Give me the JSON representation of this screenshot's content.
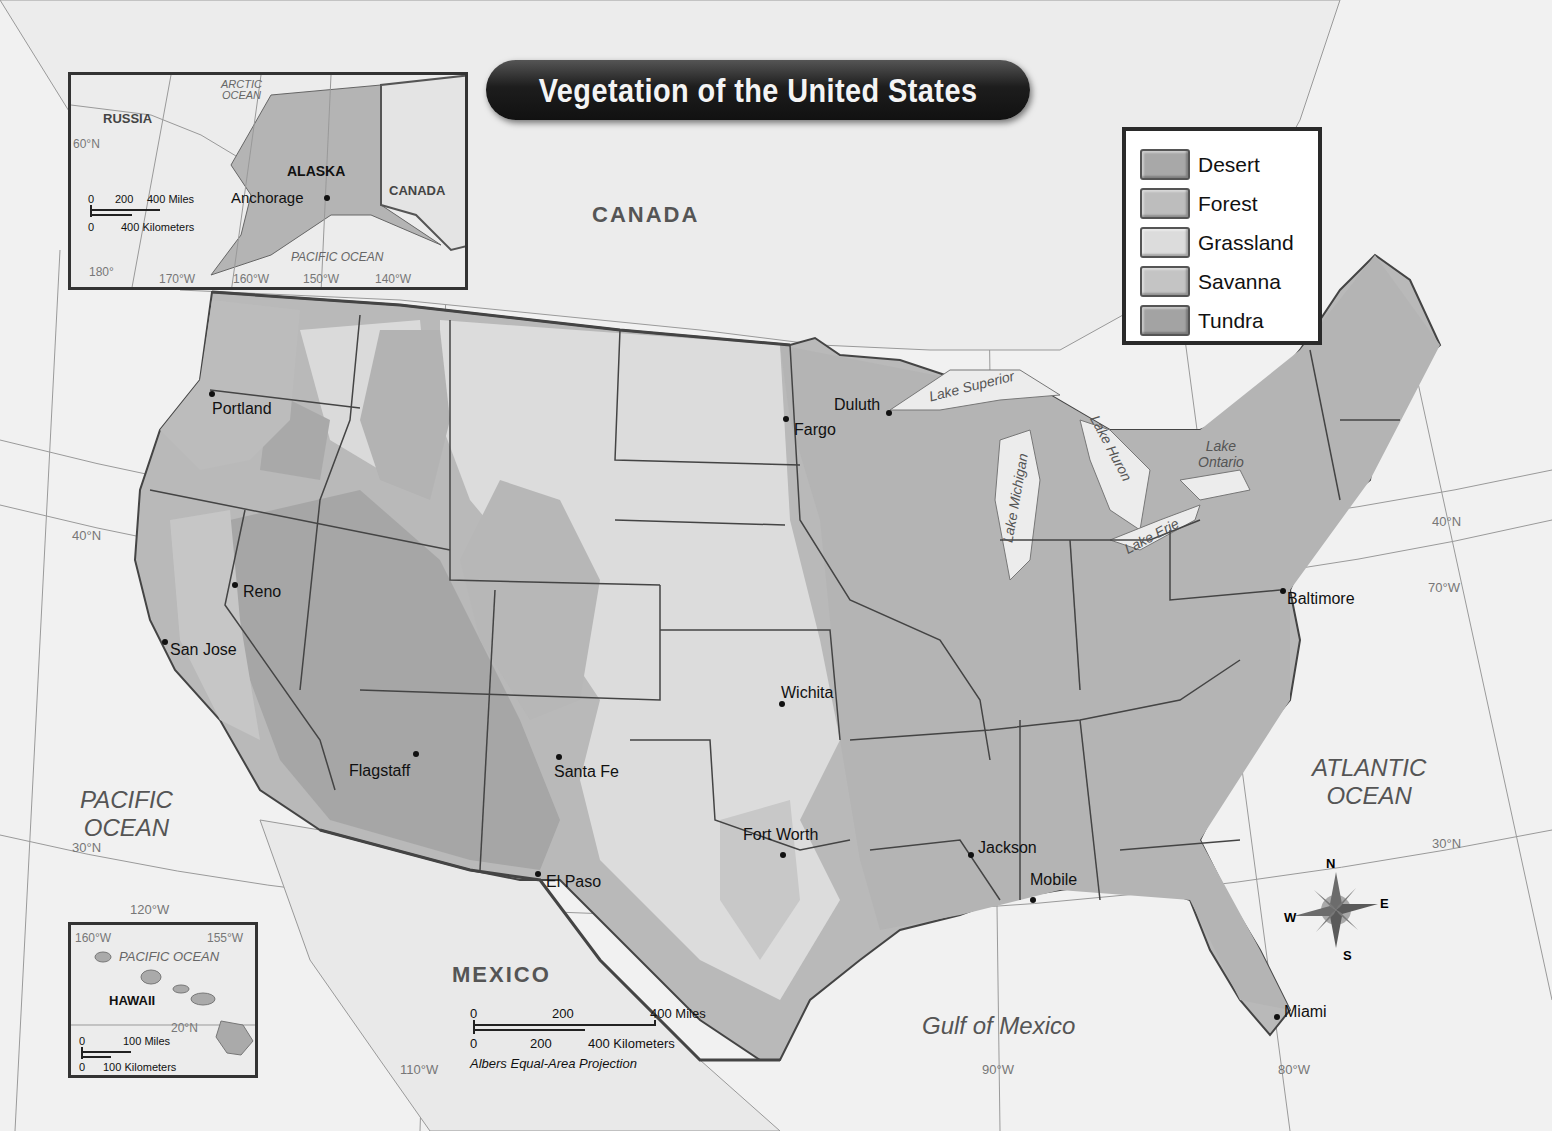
{
  "title": "Vegetation of the United States",
  "legend": {
    "items": [
      {
        "label": "Desert",
        "color": "#a8a8a8"
      },
      {
        "label": "Forest",
        "color": "#bdbdbd"
      },
      {
        "label": "Grassland",
        "color": "#dcdcdc"
      },
      {
        "label": "Savanna",
        "color": "#c4c4c4"
      },
      {
        "label": "Tundra",
        "color": "#a3a3a3"
      }
    ]
  },
  "countries": {
    "canada": "CANADA",
    "mexico": "MEXICO"
  },
  "oceans": {
    "pacific_line1": "PACIFIC",
    "pacific_line2": "OCEAN",
    "atlantic_line1": "ATLANTIC",
    "atlantic_line2": "OCEAN",
    "gulf": "Gulf of Mexico"
  },
  "lakes": {
    "superior": "Lake Superior",
    "michigan": "Lake Michigan",
    "huron": "Lake Huron",
    "erie": "Lake Erie",
    "ontario_line1": "Lake",
    "ontario_line2": "Ontario"
  },
  "cities": [
    {
      "name": "Portland",
      "x": 212,
      "y": 394,
      "lx": 212,
      "ly": 400
    },
    {
      "name": "Fargo",
      "x": 786,
      "y": 419,
      "lx": 794,
      "ly": 421
    },
    {
      "name": "Duluth",
      "x": 889,
      "y": 413,
      "lx": 834,
      "ly": 396
    },
    {
      "name": "Reno",
      "x": 235,
      "y": 585,
      "lx": 243,
      "ly": 583
    },
    {
      "name": "San Jose",
      "x": 165,
      "y": 642,
      "lx": 170,
      "ly": 641
    },
    {
      "name": "Wichita",
      "x": 782,
      "y": 704,
      "lx": 781,
      "ly": 684
    },
    {
      "name": "Flagstaff",
      "x": 416,
      "y": 754,
      "lx": 349,
      "ly": 762
    },
    {
      "name": "Santa Fe",
      "x": 559,
      "y": 757,
      "lx": 554,
      "ly": 763
    },
    {
      "name": "Fort Worth",
      "x": 783,
      "y": 855,
      "lx": 743,
      "ly": 826
    },
    {
      "name": "Jackson",
      "x": 971,
      "y": 855,
      "lx": 978,
      "ly": 839
    },
    {
      "name": "Mobile",
      "x": 1033,
      "y": 900,
      "lx": 1030,
      "ly": 871
    },
    {
      "name": "El Paso",
      "x": 538,
      "y": 874,
      "lx": 546,
      "ly": 873
    },
    {
      "name": "Baltimore",
      "x": 1283,
      "y": 591,
      "lx": 1287,
      "ly": 590
    },
    {
      "name": "Miami",
      "x": 1277,
      "y": 1017,
      "lx": 1284,
      "ly": 1003
    }
  ],
  "gridlines": {
    "lat_40_west": "40°N",
    "lat_40_east": "40°N",
    "lat_30_west": "30°N",
    "lat_30_east": "30°N",
    "lon_120": "120°W",
    "lon_110": "110°W",
    "lon_90": "90°W",
    "lon_80": "80°W",
    "lon_70": "70°W"
  },
  "scale_bar": {
    "miles_0": "0",
    "miles_200": "200",
    "miles_400": "400 Miles",
    "km_0": "0",
    "km_200": "200",
    "km_400": "400 Kilometers",
    "projection": "Albers Equal-Area Projection"
  },
  "compass": {
    "n": "N",
    "s": "S",
    "e": "E",
    "w": "W"
  },
  "alaska_inset": {
    "state": "ALASKA",
    "city": "Anchorage",
    "russia": "RUSSIA",
    "canada": "CANADA",
    "arctic_line1": "ARCTIC",
    "arctic_line2": "OCEAN",
    "pacific": "PACIFIC OCEAN",
    "lat_60": "60°N",
    "lon_180": "180°",
    "lon_170": "170°W",
    "lon_160": "160°W",
    "lon_150": "150°W",
    "lon_140": "140°W",
    "scale_miles_0": "0",
    "scale_miles_200": "200",
    "scale_miles_400": "400 Miles",
    "scale_km_0": "0",
    "scale_km_400": "400 Kilometers"
  },
  "hawaii_inset": {
    "state": "HAWAII",
    "pacific": "PACIFIC OCEAN",
    "lon_160": "160°W",
    "lon_155": "155°W",
    "lat_20": "20°N",
    "scale_miles_0": "0",
    "scale_miles_100": "100 Miles",
    "scale_km_0": "0",
    "scale_km_100": "100 Kilometers"
  }
}
